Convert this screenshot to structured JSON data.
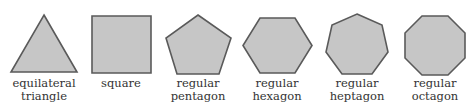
{
  "style": {
    "fill": "#c6c6c6",
    "stroke": "#5a5a5a",
    "text": "#333333"
  },
  "shapes": [
    {
      "name": "equilateral triangle",
      "label_lines": [
        "equilateral",
        "triangle"
      ],
      "sides": 3,
      "center_x": 44
    },
    {
      "name": "square",
      "label_lines": [
        "square",
        ""
      ],
      "sides": 4,
      "center_x": 121
    },
    {
      "name": "regular pentagon",
      "label_lines": [
        "regular",
        "pentagon"
      ],
      "sides": 5,
      "center_x": 198
    },
    {
      "name": "regular hexagon",
      "label_lines": [
        "regular",
        "hexagon"
      ],
      "sides": 6,
      "center_x": 277
    },
    {
      "name": "regular heptagon",
      "label_lines": [
        "regular",
        "heptagon"
      ],
      "sides": 7,
      "center_x": 357
    },
    {
      "name": "regular octagon",
      "label_lines": [
        "regular",
        "octagon"
      ],
      "sides": 8,
      "center_x": 435
    }
  ]
}
